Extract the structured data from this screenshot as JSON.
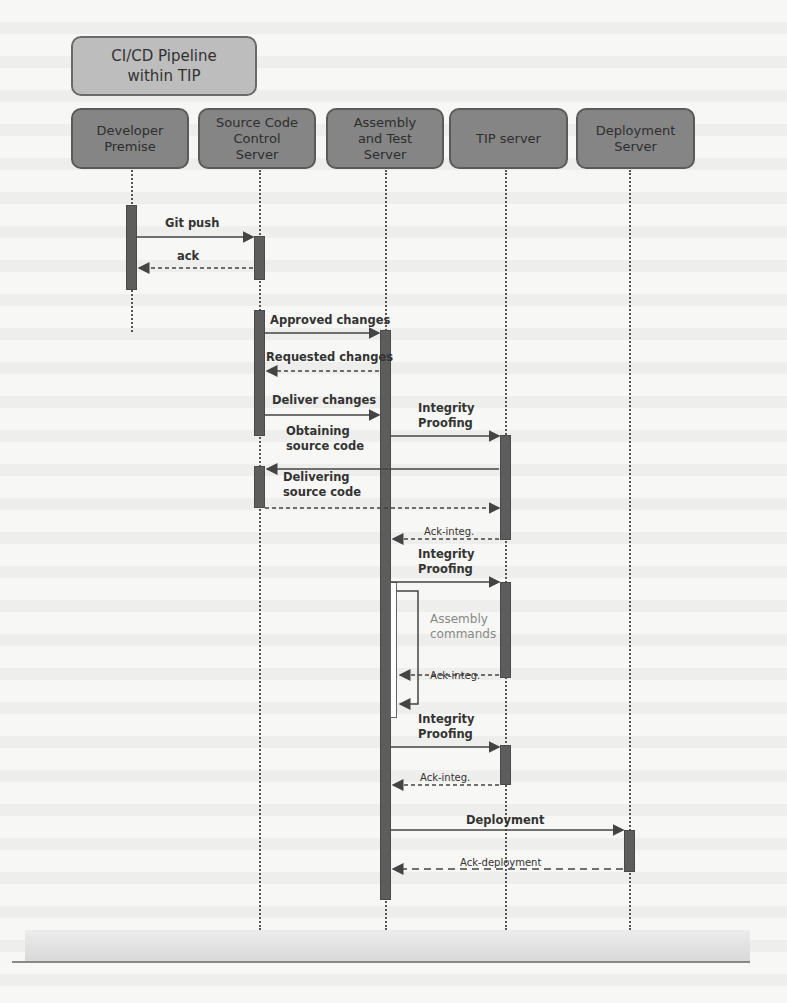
{
  "diagram": {
    "title": "CI/CD Pipeline\nwithin TIP",
    "participants": [
      {
        "id": "developer",
        "label": "Developer\nPremise"
      },
      {
        "id": "scc",
        "label": "Source Code\nControl\nServer"
      },
      {
        "id": "ats",
        "label": "Assembly\nand Test\nServer"
      },
      {
        "id": "tip",
        "label": "TIP server"
      },
      {
        "id": "deploy",
        "label": "Deployment\nServer"
      }
    ],
    "messages": [
      {
        "from": "developer",
        "to": "scc",
        "label": "Git push",
        "style": "solid"
      },
      {
        "from": "scc",
        "to": "developer",
        "label": "ack",
        "style": "dashed"
      },
      {
        "from": "scc",
        "to": "ats",
        "label": "Approved changes",
        "style": "solid"
      },
      {
        "from": "ats",
        "to": "scc",
        "label": "Requested changes",
        "style": "dashed"
      },
      {
        "from": "scc",
        "to": "ats",
        "label": "Deliver changes",
        "style": "solid"
      },
      {
        "from": "ats",
        "to": "tip",
        "label": "Integrity\nProofing",
        "style": "solid"
      },
      {
        "from": "tip",
        "to": "scc",
        "label": "Obtaining\nsource code",
        "style": "solid"
      },
      {
        "from": "scc",
        "to": "tip",
        "label": "Delivering\nsource code",
        "style": "dashed"
      },
      {
        "from": "tip",
        "to": "ats",
        "label": "Ack-integ.",
        "style": "dashed"
      },
      {
        "from": "ats",
        "to": "tip",
        "label": "Integrity\nProofing",
        "style": "solid"
      },
      {
        "from": "ats",
        "to": "ats",
        "label": "Assembly\ncommands",
        "style": "self"
      },
      {
        "from": "tip",
        "to": "ats",
        "label": "Ack-integ.",
        "style": "dashed"
      },
      {
        "from": "ats",
        "to": "tip",
        "label": "Integrity\nProofing",
        "style": "solid"
      },
      {
        "from": "tip",
        "to": "ats",
        "label": "Ack-integ.",
        "style": "dashed"
      },
      {
        "from": "ats",
        "to": "deploy",
        "label": "Deployment",
        "style": "solid"
      },
      {
        "from": "deploy",
        "to": "ats",
        "label": "Ack-deployment",
        "style": "dashed"
      }
    ],
    "colors": {
      "title_fill": "#bdbdbd",
      "participant_fill": "#858585",
      "activation_fill": "#5d5d5d",
      "line": "#444444"
    }
  }
}
